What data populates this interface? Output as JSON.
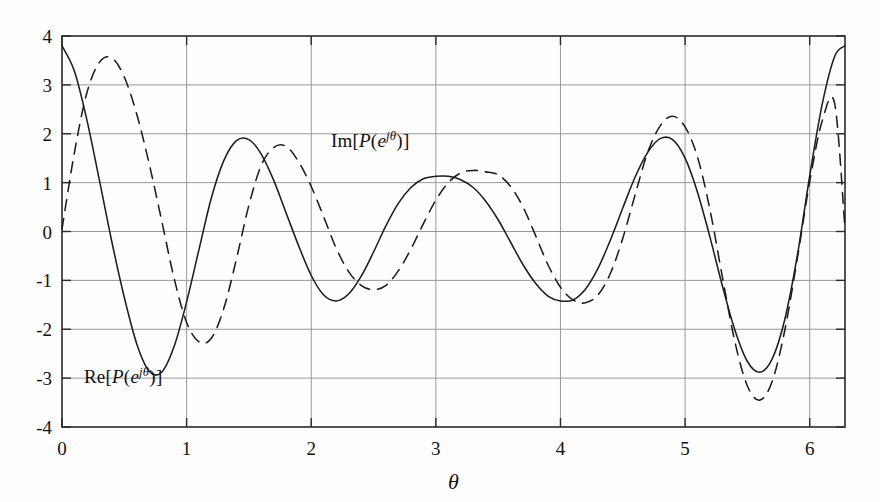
{
  "chart_data": {
    "type": "line",
    "title": "",
    "xlabel": "θ",
    "ylabel": "",
    "xlim": [
      0,
      6.283185
    ],
    "ylim": [
      -4,
      4
    ],
    "grid": true,
    "legend_position": "inline-annotation",
    "x_ticks": [
      "0",
      "1",
      "2",
      "3",
      "4",
      "5",
      "6"
    ],
    "x_tick_values": [
      0,
      1,
      2,
      3,
      4,
      5,
      6
    ],
    "y_ticks": [
      "4",
      "3",
      "2",
      "1",
      "0",
      "-1",
      "-2",
      "-3",
      "-4"
    ],
    "y_tick_values": [
      4,
      3,
      2,
      1,
      0,
      -1,
      -2,
      -3,
      -4
    ],
    "series": [
      {
        "name": "Re[P(e^{jθ})]",
        "label_html": "<span class=\"rm\">Re</span>[<span class=\"it\">P</span>(<span class=\"it\">e</span><sup><span class=\"it\">jθ</span></sup>)]",
        "style": "solid",
        "color": "#1d1d1d",
        "x": [
          0.0,
          0.1,
          0.2,
          0.3,
          0.4,
          0.5,
          0.6,
          0.7,
          0.8,
          0.9,
          1.0,
          1.1,
          1.2,
          1.3,
          1.4,
          1.5,
          1.6,
          1.7,
          1.8,
          1.9,
          2.0,
          2.1,
          2.2,
          2.3,
          2.4,
          2.5,
          2.6,
          2.7,
          2.8,
          2.9,
          3.0,
          3.1,
          3.2,
          3.3,
          3.4,
          3.5,
          3.6,
          3.7,
          3.8,
          3.9,
          4.0,
          4.1,
          4.2,
          4.3,
          4.4,
          4.5,
          4.6,
          4.7,
          4.8,
          4.9,
          5.0,
          5.1,
          5.2,
          5.3,
          5.4,
          5.5,
          5.6,
          5.7,
          5.8,
          5.9,
          6.0,
          6.1,
          6.2,
          6.283185
        ],
        "y": [
          3.8,
          3.28,
          2.28,
          1.05,
          -0.21,
          -1.35,
          -2.3,
          -2.86,
          -2.88,
          -2.35,
          -1.44,
          -0.36,
          0.7,
          1.46,
          1.86,
          1.88,
          1.58,
          1.04,
          0.37,
          -0.3,
          -0.9,
          -1.3,
          -1.42,
          -1.28,
          -0.92,
          -0.42,
          0.12,
          0.58,
          0.9,
          1.08,
          1.13,
          1.13,
          1.06,
          0.9,
          0.62,
          0.24,
          -0.22,
          -0.68,
          -1.06,
          -1.32,
          -1.42,
          -1.4,
          -1.18,
          -0.76,
          -0.18,
          0.48,
          1.12,
          1.62,
          1.9,
          1.88,
          1.5,
          0.8,
          -0.12,
          -1.12,
          -2.02,
          -2.66,
          -2.88,
          -2.6,
          -1.8,
          -0.5,
          1.14,
          2.6,
          3.58,
          3.8
        ]
      },
      {
        "name": "Im[P(e^{jθ})]",
        "label_html": "<span class=\"rm\">Im</span>[<span class=\"it\">P</span>(<span class=\"it\">e</span><sup><span class=\"it\">jθ</span></sup>)]",
        "style": "dashed",
        "color": "#1d1d1d",
        "x": [
          0.0,
          0.1,
          0.2,
          0.3,
          0.4,
          0.5,
          0.6,
          0.7,
          0.8,
          0.9,
          1.0,
          1.1,
          1.2,
          1.3,
          1.4,
          1.5,
          1.6,
          1.7,
          1.8,
          1.9,
          2.0,
          2.1,
          2.2,
          2.3,
          2.4,
          2.5,
          2.6,
          2.7,
          2.8,
          2.9,
          3.0,
          3.1,
          3.2,
          3.3,
          3.4,
          3.5,
          3.6,
          3.7,
          3.8,
          3.9,
          4.0,
          4.1,
          4.2,
          4.3,
          4.4,
          4.5,
          4.6,
          4.7,
          4.8,
          4.9,
          5.0,
          5.1,
          5.2,
          5.3,
          5.4,
          5.5,
          5.6,
          5.7,
          5.8,
          5.9,
          6.0,
          6.1,
          6.2,
          6.283185
        ],
        "y": [
          0.05,
          1.62,
          2.84,
          3.46,
          3.55,
          3.16,
          2.4,
          1.38,
          0.22,
          -0.96,
          -1.86,
          -2.26,
          -2.18,
          -1.56,
          -0.56,
          0.54,
          1.36,
          1.72,
          1.74,
          1.42,
          0.92,
          0.3,
          -0.34,
          -0.82,
          -1.1,
          -1.19,
          -1.1,
          -0.8,
          -0.36,
          0.16,
          0.64,
          1.0,
          1.2,
          1.25,
          1.22,
          1.16,
          0.92,
          0.5,
          -0.08,
          -0.68,
          -1.14,
          -1.4,
          -1.46,
          -1.3,
          -0.86,
          -0.14,
          0.76,
          1.62,
          2.16,
          2.36,
          2.14,
          1.52,
          0.44,
          -0.94,
          -2.26,
          -3.16,
          -3.45,
          -3.06,
          -2.02,
          -0.56,
          1.02,
          2.26,
          2.62,
          0.05
        ]
      }
    ],
    "annotations": [
      {
        "text": "Im[P(e^{jθ})]",
        "x": 1.86,
        "y": 1.52
      },
      {
        "text": "Re[P(e^{jθ})]",
        "x": 0.32,
        "y": -3.22
      }
    ]
  }
}
